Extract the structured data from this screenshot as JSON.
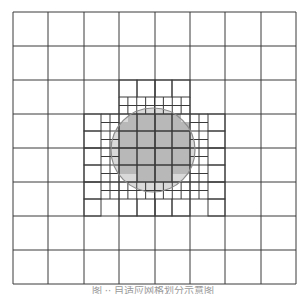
{
  "figure": {
    "type": "quadtree-adaptive-mesh",
    "colors": {
      "background": "#ffffff",
      "grid_line": "#3a3a3a",
      "circle_fill": "#d9d9d9",
      "circle_outline": "#8c8c8c",
      "interior_cell_fill": "#b8b8b8"
    },
    "coarse_grid": {
      "x": [
        13,
        48,
        84,
        119,
        155,
        190,
        225,
        261,
        296
      ],
      "y": [
        12,
        46,
        80,
        114,
        148,
        182,
        216,
        250,
        284
      ]
    },
    "circle": {
      "cx": 153,
      "cy": 150,
      "r": 42
    },
    "interior_cells": [
      [
        137,
        114,
        35,
        17
      ],
      [
        119,
        131,
        71,
        34
      ],
      [
        137,
        165,
        35,
        17
      ],
      [
        128,
        114,
        9,
        17
      ],
      [
        172,
        114,
        9,
        17
      ],
      [
        119,
        122,
        9,
        9
      ],
      [
        181,
        122,
        9,
        9
      ],
      [
        128,
        165,
        9,
        9
      ],
      [
        172,
        165,
        9,
        9
      ],
      [
        119,
        165,
        9,
        9
      ],
      [
        181,
        165,
        9,
        9
      ]
    ],
    "refined_cells_level1": [
      [
        119,
        80,
        18,
        17
      ],
      [
        137,
        80,
        18,
        17
      ],
      [
        155,
        80,
        17,
        17
      ],
      [
        172,
        80,
        18,
        17
      ],
      [
        84,
        114,
        17,
        17
      ],
      [
        84,
        131,
        17,
        17
      ],
      [
        84,
        148,
        17,
        17
      ],
      [
        84,
        165,
        17,
        17
      ],
      [
        84,
        182,
        17,
        17
      ],
      [
        84,
        199,
        17,
        17
      ],
      [
        208,
        114,
        17,
        17
      ],
      [
        208,
        131,
        17,
        17
      ],
      [
        208,
        148,
        17,
        17
      ],
      [
        208,
        165,
        17,
        17
      ],
      [
        208,
        182,
        17,
        17
      ],
      [
        208,
        199,
        17,
        17
      ],
      [
        119,
        199,
        18,
        17
      ],
      [
        137,
        199,
        18,
        17
      ],
      [
        155,
        199,
        17,
        17
      ],
      [
        172,
        199,
        18,
        17
      ],
      [
        119,
        114,
        18,
        17
      ],
      [
        137,
        114,
        18,
        17
      ],
      [
        155,
        114,
        17,
        17
      ],
      [
        172,
        114,
        18,
        17
      ],
      [
        119,
        131,
        18,
        17
      ],
      [
        137,
        131,
        18,
        17
      ],
      [
        155,
        131,
        17,
        17
      ],
      [
        172,
        131,
        18,
        17
      ],
      [
        119,
        148,
        18,
        17
      ],
      [
        137,
        148,
        18,
        17
      ],
      [
        155,
        148,
        17,
        17
      ],
      [
        172,
        148,
        18,
        17
      ],
      [
        119,
        165,
        18,
        17
      ],
      [
        137,
        165,
        18,
        17
      ],
      [
        155,
        165,
        17,
        17
      ],
      [
        172,
        165,
        18,
        17
      ]
    ],
    "refined_strips_level2": [
      {
        "x0": 119,
        "x1": 190,
        "y0": 97,
        "y1": 114,
        "orientation": "horizontal"
      },
      {
        "x0": 119,
        "x1": 190,
        "y0": 182,
        "y1": 199,
        "orientation": "horizontal"
      },
      {
        "x0": 101,
        "x1": 119,
        "y0": 114,
        "y1": 199,
        "orientation": "vertical"
      },
      {
        "x0": 190,
        "x1": 208,
        "y0": 114,
        "y1": 199,
        "orientation": "vertical"
      }
    ]
  },
  "caption": "图 ·· 自适应网格划分示意图"
}
